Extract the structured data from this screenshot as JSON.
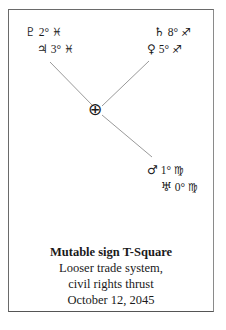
{
  "diagram": {
    "center_symbol": "⊕",
    "center_name": "earth",
    "planets": [
      {
        "name": "pluto",
        "glyph": "♇",
        "degree": "2°",
        "sign_glyph": "♓",
        "sign": "pisces"
      },
      {
        "name": "jupiter",
        "glyph": "♃",
        "degree": "3°",
        "sign_glyph": "♓",
        "sign": "pisces"
      },
      {
        "name": "saturn",
        "glyph": "♄",
        "degree": "8°",
        "sign_glyph": "♐",
        "sign": "sagittarius"
      },
      {
        "name": "venus",
        "glyph": "♀",
        "degree": "5°",
        "sign_glyph": "♐",
        "sign": "sagittarius"
      },
      {
        "name": "mars",
        "glyph": "♂",
        "degree": "1°",
        "sign_glyph": "♍",
        "sign": "virgo"
      },
      {
        "name": "uranus",
        "glyph": "♅",
        "degree": "0°",
        "sign_glyph": "♍",
        "sign": "virgo"
      }
    ],
    "line_color": "#999999"
  },
  "caption": {
    "title": "Mutable sign T-Square",
    "line1": "Looser trade system,",
    "line2": "civil rights thrust",
    "date": "October 12, 2045"
  }
}
